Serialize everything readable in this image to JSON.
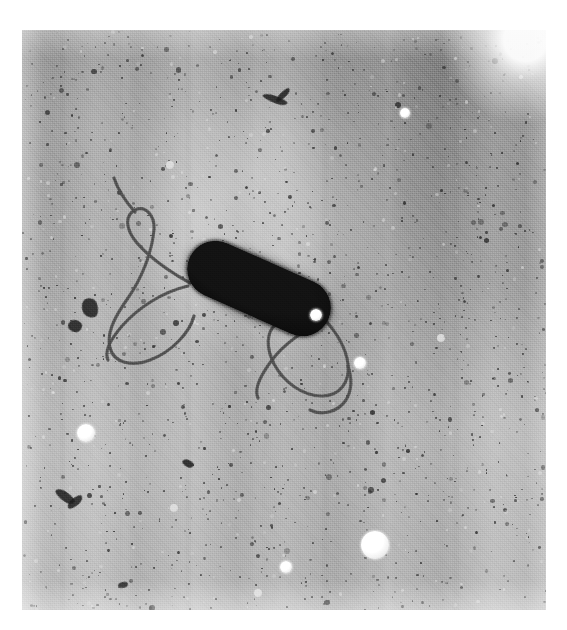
{
  "image": {
    "kind": "transmission-electron-micrograph",
    "subject": "flagellated rod-shaped bacterium",
    "caption": "",
    "background_tone": "#ababab",
    "cell_color": "#080808",
    "flagella_color": "#4e4e4e",
    "bead_color": "#ffffff",
    "plate": {
      "left": 22,
      "top": 30,
      "width": 524,
      "height": 580
    }
  },
  "cell": {
    "label": "bacterial-cell-body",
    "shape": "capsule",
    "left": 161,
    "top": 230,
    "length": 152,
    "width": 57,
    "rotation_deg": 24
  },
  "flagella": [
    {
      "name": "anterior-flagellum-loop",
      "d": "M168 253 C150 243 128 228 115 213 C104 200 102 186 113 180 C124 175 133 186 132 200 C130 222 120 248 106 268 C94 285 84 302 88 318 C92 333 110 337 128 330 C150 322 168 302 172 286"
    },
    {
      "name": "anterior-flagellum-filament",
      "d": "M166 256 C140 262 116 278 100 296 C88 310 82 322 86 330"
    },
    {
      "name": "anterior-flagellum-tip",
      "d": "M113 182 C104 172 96 160 92 148"
    },
    {
      "name": "posterior-flagellum-loop",
      "d": "M303 290 C314 302 324 318 326 334 C328 352 318 366 300 366 C280 366 262 352 252 334 C244 318 244 302 254 294"
    },
    {
      "name": "posterior-flagellum-arc",
      "d": "M300 292 C282 300 262 314 250 330 C238 346 232 360 236 368"
    },
    {
      "name": "posterior-flagellum-tail",
      "d": "M326 336 C330 348 330 360 324 370 C316 382 300 386 288 380"
    }
  ],
  "beads": [
    {
      "name": "bead-large-lower",
      "cx": 353,
      "cy": 515,
      "r": 14
    },
    {
      "name": "bead-left-mid",
      "cx": 64,
      "cy": 403,
      "r": 9
    },
    {
      "name": "bead-near-cell",
      "cx": 294,
      "cy": 285,
      "r": 6
    },
    {
      "name": "bead-right-mid",
      "cx": 338,
      "cy": 333,
      "r": 6
    },
    {
      "name": "bead-bottom-mid",
      "cx": 264,
      "cy": 537,
      "r": 6
    },
    {
      "name": "bead-bottom-left",
      "cx": 236,
      "cy": 563,
      "r": 4
    },
    {
      "name": "bead-upper-right",
      "cx": 383,
      "cy": 83,
      "r": 5
    },
    {
      "name": "bead-upper-mid",
      "cx": 148,
      "cy": 135,
      "r": 4
    },
    {
      "name": "bead-right-far",
      "cx": 419,
      "cy": 308,
      "r": 4
    },
    {
      "name": "bead-mid-faint",
      "cx": 152,
      "cy": 478,
      "r": 4
    }
  ],
  "debris": [
    {
      "name": "debris-clump-left-upper",
      "left": 60,
      "top": 268,
      "w": 16,
      "h": 20,
      "rot": -18
    },
    {
      "name": "debris-clump-left-lower",
      "left": 46,
      "top": 290,
      "w": 14,
      "h": 12,
      "rot": 12
    },
    {
      "name": "debris-v-lower-left",
      "left": 32,
      "top": 462,
      "w": 22,
      "h": 9,
      "rot": 35
    },
    {
      "name": "debris-v-lower-left-2",
      "left": 44,
      "top": 468,
      "w": 18,
      "h": 8,
      "rot": -40
    },
    {
      "name": "debris-branched-top",
      "left": 240,
      "top": 66,
      "w": 26,
      "h": 7,
      "rot": 20
    },
    {
      "name": "debris-branched-top-2",
      "left": 252,
      "top": 62,
      "w": 18,
      "h": 6,
      "rot": -45
    },
    {
      "name": "debris-mid-lower",
      "left": 160,
      "top": 430,
      "w": 12,
      "h": 7,
      "rot": 25
    },
    {
      "name": "debris-bottom-left",
      "left": 96,
      "top": 552,
      "w": 10,
      "h": 6,
      "rot": -15
    }
  ]
}
